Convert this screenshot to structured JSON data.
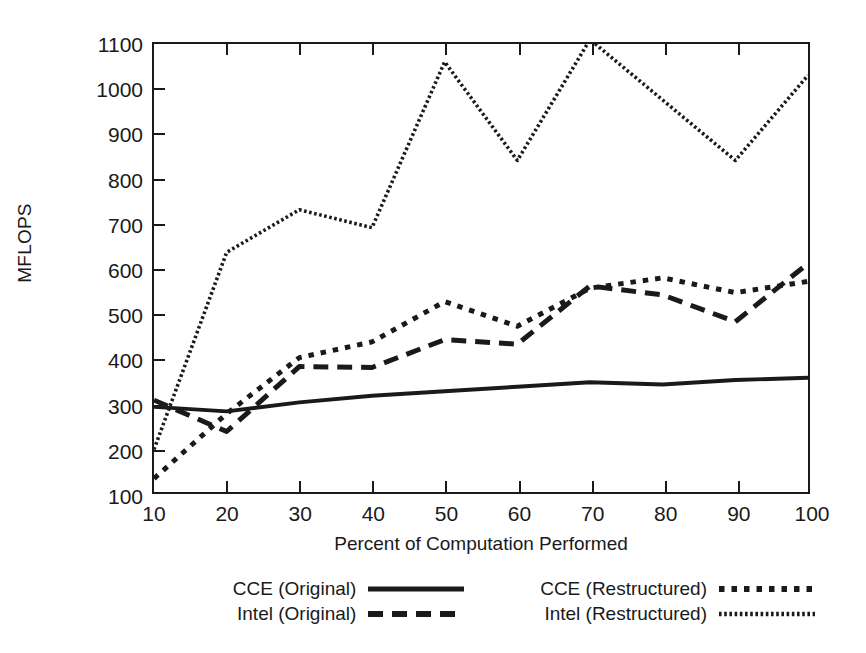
{
  "chart_data": {
    "type": "line",
    "title": "",
    "xlabel": "Percent of Computation Performed",
    "ylabel": "MFLOPS",
    "xlim": [
      10,
      100
    ],
    "ylim": [
      100,
      1100
    ],
    "xticks": [
      10,
      20,
      30,
      40,
      50,
      60,
      70,
      80,
      90,
      100
    ],
    "yticks": [
      100,
      200,
      300,
      400,
      500,
      600,
      700,
      800,
      900,
      1000,
      1100
    ],
    "grid": false,
    "legend_position": "below-plot",
    "x": [
      10,
      20,
      30,
      40,
      50,
      60,
      70,
      80,
      90,
      100
    ],
    "series": [
      {
        "name": "CCE (Original)",
        "style": "solid",
        "color": "#1a1a1a",
        "values": [
          290,
          280,
          300,
          315,
          325,
          335,
          345,
          340,
          350,
          355
        ]
      },
      {
        "name": "Intel (Original)",
        "style": "dashed",
        "color": "#1a1a1a",
        "values": [
          305,
          235,
          380,
          378,
          440,
          430,
          560,
          540,
          480,
          610
        ]
      },
      {
        "name": "CCE (Restructured)",
        "style": "dotted",
        "color": "#1a1a1a",
        "values": [
          130,
          275,
          400,
          435,
          525,
          470,
          555,
          578,
          545,
          570
        ]
      },
      {
        "name": "Intel (Restructured)",
        "style": "fine-dotted",
        "color": "#1a1a1a",
        "values": [
          195,
          635,
          730,
          690,
          1060,
          840,
          1110,
          975,
          840,
          1030
        ]
      }
    ]
  },
  "axes": {
    "ylabel": "MFLOPS",
    "xlabel": "Percent of Computation Performed",
    "ytick_labels": [
      "100",
      "200",
      "300",
      "400",
      "500",
      "600",
      "700",
      "800",
      "900",
      "1000",
      "1100"
    ],
    "xtick_labels": [
      "10",
      "20",
      "30",
      "40",
      "50",
      "60",
      "70",
      "80",
      "90",
      "100"
    ]
  },
  "legend": {
    "entries": [
      {
        "label": "CCE (Original)",
        "style": "solid"
      },
      {
        "label": "CCE (Restructured)",
        "style": "dotted"
      },
      {
        "label": "Intel (Original)",
        "style": "dashed"
      },
      {
        "label": "Intel (Restructured)",
        "style": "fine-dotted"
      }
    ]
  },
  "colors": {
    "ink": "#1a1a1a",
    "background": "#ffffff"
  }
}
